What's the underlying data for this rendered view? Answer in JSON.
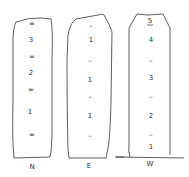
{
  "columns": [
    {
      "name": "N",
      "marks": [
        {
          "text": "=",
          "y": 24
        },
        {
          "text": "3",
          "y": 40
        },
        {
          "text": "=",
          "y": 57
        },
        {
          "text": "2",
          "y": 73
        },
        {
          "text": "=",
          "y": 90
        },
        {
          "text": "1",
          "y": 112
        },
        {
          "text": "=",
          "y": 135
        }
      ]
    },
    {
      "name": "E",
      "marks": [
        {
          "text": "–",
          "y": 26
        },
        {
          "text": "1",
          "y": 40
        },
        {
          "text": "–",
          "y": 61
        },
        {
          "text": "1",
          "y": 80
        },
        {
          "text": "–",
          "y": 97
        },
        {
          "text": "1",
          "y": 116
        },
        {
          "text": "–",
          "y": 136
        }
      ]
    },
    {
      "name": "W",
      "marks": [
        {
          "text": "5",
          "y": 21
        },
        {
          "text": "4",
          "y": 40
        },
        {
          "text": "–",
          "y": 61
        },
        {
          "text": "3",
          "y": 78
        },
        {
          "text": "–",
          "y": 97
        },
        {
          "text": "2",
          "y": 116
        },
        {
          "text": "–",
          "y": 135
        },
        {
          "text": "1",
          "y": 147
        }
      ]
    }
  ]
}
